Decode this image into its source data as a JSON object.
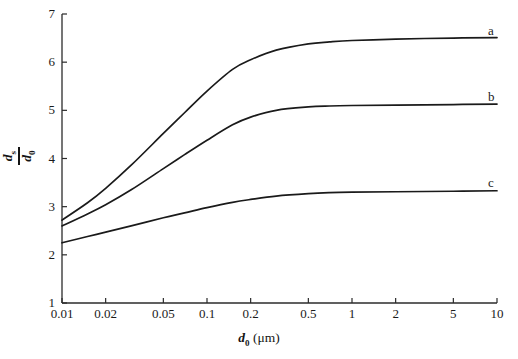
{
  "chart_data": {
    "type": "line",
    "title": "",
    "subtitle": "",
    "xlabel": "d_0 (μm)",
    "ylabel": "d_s / d_0",
    "xscale": "log",
    "yscale": "linear",
    "xlim": [
      0.01,
      10
    ],
    "ylim": [
      1,
      7
    ],
    "grid": false,
    "legend_position": "right-inline-curve-labels",
    "xticks": [
      0.01,
      0.02,
      0.05,
      0.1,
      0.2,
      0.5,
      1,
      2,
      5,
      10
    ],
    "xtick_labels": [
      "0.01",
      "0.02",
      "0.05",
      "0.1",
      "0.2",
      "0.5",
      "1",
      "2",
      "5",
      "10"
    ],
    "yticks": [
      1,
      2,
      3,
      4,
      5,
      6,
      7
    ],
    "ytick_labels": [
      "1",
      "2",
      "3",
      "4",
      "5",
      "6",
      "7"
    ],
    "x": [
      0.01,
      0.015,
      0.02,
      0.03,
      0.05,
      0.07,
      0.1,
      0.15,
      0.2,
      0.3,
      0.5,
      0.7,
      1,
      2,
      5,
      10
    ],
    "series": [
      {
        "name": "a",
        "label": "a",
        "color": "#1a1a1a",
        "values": [
          2.72,
          3.08,
          3.38,
          3.86,
          4.52,
          4.95,
          5.4,
          5.85,
          6.05,
          6.25,
          6.38,
          6.42,
          6.45,
          6.48,
          6.5,
          6.51
        ]
      },
      {
        "name": "b",
        "label": "b",
        "color": "#1a1a1a",
        "values": [
          2.6,
          2.85,
          3.04,
          3.35,
          3.79,
          4.08,
          4.38,
          4.7,
          4.86,
          5.0,
          5.07,
          5.09,
          5.1,
          5.11,
          5.12,
          5.13
        ]
      },
      {
        "name": "c",
        "label": "c",
        "color": "#1a1a1a",
        "values": [
          2.25,
          2.38,
          2.47,
          2.6,
          2.77,
          2.87,
          2.98,
          3.09,
          3.15,
          3.22,
          3.27,
          3.29,
          3.3,
          3.31,
          3.32,
          3.33
        ]
      }
    ],
    "curve_labels": [
      {
        "text": "a",
        "at_x": 10,
        "at_y": 6.65
      },
      {
        "text": "b",
        "at_x": 10,
        "at_y": 5.28
      },
      {
        "text": "c",
        "at_x": 10,
        "at_y": 3.5
      }
    ],
    "axis_color": "#2b2b2b",
    "background": "#ffffff"
  },
  "axes": {
    "x_title_main": "d",
    "x_title_sub": "0",
    "x_title_units": " (μm)",
    "y_title_num_main": "d",
    "y_title_num_sub": "s",
    "y_title_den_main": "d",
    "y_title_den_sub": "0"
  }
}
